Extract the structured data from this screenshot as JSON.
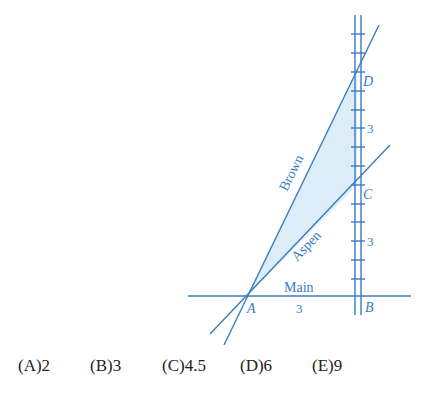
{
  "figure": {
    "colors": {
      "line": "#3a7cc0",
      "fill": "#dcedf8",
      "text": "#3a7cc0"
    },
    "roads": {
      "main": {
        "label": "Main",
        "segment_label": "3"
      },
      "brown": {
        "label": "Brown"
      },
      "aspen": {
        "label": "Aspen"
      }
    },
    "points": {
      "A": "A",
      "B": "B",
      "C": "C",
      "D": "D"
    },
    "segment_labels": {
      "DC": "3",
      "CB": "3",
      "AB": "3"
    }
  },
  "choices": [
    {
      "letter": "(A)",
      "value": "2"
    },
    {
      "letter": "(B)",
      "value": "3"
    },
    {
      "letter": "(C)",
      "value": "4.5"
    },
    {
      "letter": "(D)",
      "value": "6"
    },
    {
      "letter": "(E)",
      "value": "9"
    }
  ]
}
